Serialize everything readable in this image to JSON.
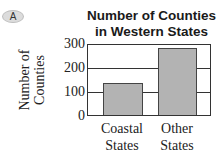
{
  "badge": {
    "label": "A"
  },
  "chart_data": {
    "type": "bar",
    "title": "Number of Counties in Western States",
    "title_lines": [
      "Number of Counties",
      "in Western States"
    ],
    "xlabel": "",
    "ylabel": "Number of Counties",
    "ylabel_lines": [
      "Number of",
      "Counties"
    ],
    "categories": [
      "Coastal States",
      "Other States"
    ],
    "category_lines": [
      [
        "Coastal",
        "States"
      ],
      [
        "Other",
        "States"
      ]
    ],
    "values": [
      135,
      285
    ],
    "ylim": [
      0,
      300
    ],
    "yticks": [
      0,
      100,
      200,
      300
    ],
    "grid": true,
    "bar_color": "#b3b3b3"
  }
}
